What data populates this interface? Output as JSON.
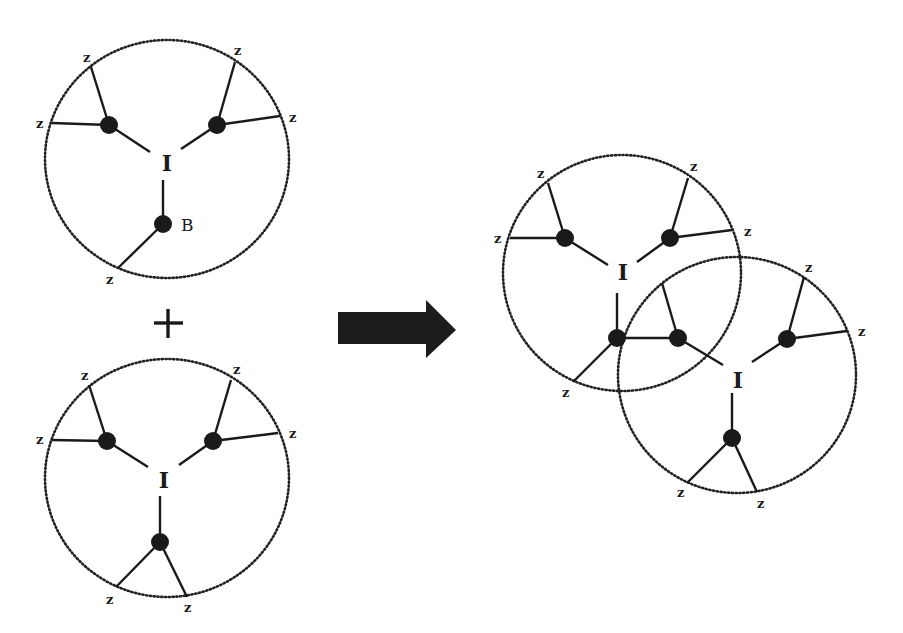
{
  "diagram": {
    "operator_label": "+",
    "reaction_arrow": "right-arrow",
    "colors": {
      "ink": "#1a1a1a",
      "background": "#ffffff"
    },
    "reactant_1": {
      "core_label": "I",
      "special_node_label": "B",
      "end_labels": [
        "z",
        "z",
        "z",
        "z",
        "z"
      ]
    },
    "reactant_2": {
      "core_label": "I",
      "end_labels": [
        "z",
        "z",
        "z",
        "z",
        "z",
        "z"
      ]
    },
    "product": {
      "unit_a": {
        "core_label": "I",
        "end_labels": [
          "z",
          "z",
          "z",
          "z",
          "z"
        ]
      },
      "unit_b": {
        "core_label": "I",
        "end_labels": [
          "z",
          "z",
          "z",
          "z"
        ]
      }
    }
  }
}
